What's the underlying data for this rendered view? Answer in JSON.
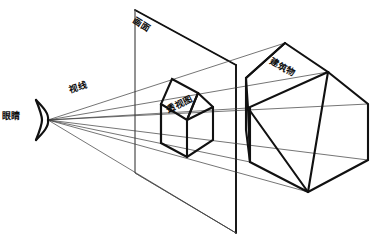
{
  "diagram": {
    "background_color": "#ffffff",
    "line_color": "#111111",
    "ray_color": "#3a3a3a",
    "labels": {
      "eye": "眼睛",
      "sight_line": "视线",
      "picture_plane": "画面",
      "perspective_drawing": "透视图",
      "building": "建筑物"
    },
    "elements": {
      "eye_point": "(48, 120)",
      "picture_plane_shape": "parallelogram",
      "projected_image": "house-outline",
      "object": "house-outline"
    }
  }
}
